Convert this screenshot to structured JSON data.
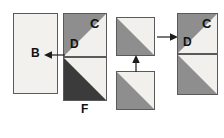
{
  "diagram": {
    "background_color": "#ffffff",
    "stroke_color": "#5a5a5a",
    "label_color": "#121212",
    "fills": {
      "light": "#f1f0ed",
      "gray": "#8e8e8e",
      "dark": "#3b3b3b"
    },
    "left_group": {
      "name": "left-assembly",
      "blocks": [
        {
          "id": "block-b",
          "label": "B",
          "kind": "plain-rectangle",
          "fill": "light"
        },
        {
          "id": "block-cd-top",
          "label_c": "C",
          "label_d": "D",
          "kind": "square-split-upper-left-gray"
        },
        {
          "id": "block-f-bottom",
          "label": "F",
          "kind": "square-split-lower-left-dark"
        }
      ],
      "arrows": [
        {
          "id": "arrow-left",
          "direction": "left",
          "label": ""
        }
      ]
    },
    "right_group": {
      "name": "right-assembly",
      "blocks": [
        {
          "id": "block-src-top",
          "label": "",
          "kind": "square-split-lower-left-gray"
        },
        {
          "id": "block-src-bottom",
          "label": "",
          "kind": "square-split-lower-left-gray"
        },
        {
          "id": "block-cd-top-right",
          "label_c": "C",
          "label_d": "D",
          "kind": "square-split-upper-left-gray"
        },
        {
          "id": "block-bottom-right",
          "label": "",
          "kind": "square-split-lower-left-gray"
        }
      ],
      "arrows": [
        {
          "id": "arrow-right",
          "direction": "right",
          "label": ""
        },
        {
          "id": "arrow-up",
          "direction": "up",
          "label": ""
        }
      ]
    },
    "labels": {
      "b": "B",
      "c": "C",
      "d": "D",
      "f": "F",
      "c2": "C",
      "d2": "D"
    }
  }
}
